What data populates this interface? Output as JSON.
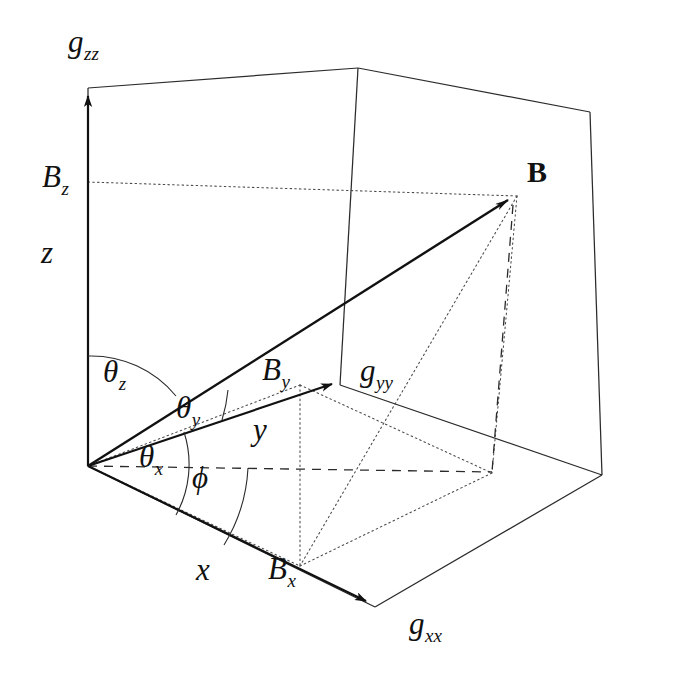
{
  "figure": {
    "type": "3d-vector-diagram",
    "background_color": "#ffffff",
    "line_color": "#1a1a1a"
  },
  "axes": [
    {
      "id": "z",
      "axis_label": "z",
      "tensor_label_base": "g",
      "tensor_label_sub": "zz",
      "component_base": "B",
      "component_sub": "z",
      "direction": "up"
    },
    {
      "id": "y",
      "axis_label": "y",
      "tensor_label_base": "g",
      "tensor_label_sub": "yy",
      "component_base": "B",
      "component_sub": "y",
      "direction": "upper-right"
    },
    {
      "id": "x",
      "axis_label": "x",
      "tensor_label_base": "g",
      "tensor_label_sub": "xx",
      "component_base": "B",
      "component_sub": "x",
      "direction": "lower-right"
    }
  ],
  "labels": {
    "g_zz": {
      "base": "g",
      "sub": "zz"
    },
    "g_yy": {
      "base": "g",
      "sub": "yy"
    },
    "g_xx": {
      "base": "g",
      "sub": "xx"
    },
    "B_z": {
      "base": "B",
      "sub": "z"
    },
    "B_y": {
      "base": "B",
      "sub": "y"
    },
    "B_x": {
      "base": "B",
      "sub": "x"
    },
    "z": {
      "base": "z",
      "sub": ""
    },
    "y": {
      "base": "y",
      "sub": ""
    },
    "x": {
      "base": "x",
      "sub": ""
    },
    "B_vector": {
      "base": "B",
      "sub": ""
    },
    "theta_z": {
      "base": "θ",
      "sub": "z"
    },
    "theta_y": {
      "base": "θ",
      "sub": "y"
    },
    "theta_x": {
      "base": "θ",
      "sub": "x"
    },
    "phi": {
      "base": "ϕ",
      "sub": ""
    }
  },
  "angles": [
    {
      "name": "theta_z",
      "between": "z-axis and B",
      "symbol": "θz"
    },
    {
      "name": "theta_y",
      "between": "y-axis and B",
      "symbol": "θy"
    },
    {
      "name": "theta_x",
      "between": "x-axis and B projection",
      "symbol": "θx"
    },
    {
      "name": "phi",
      "between": "azimuthal reference and x-axis",
      "symbol": "ϕ"
    }
  ],
  "line_styles": {
    "axis": "solid-with-arrow",
    "box_edge": "solid-thin",
    "projection": "dotted",
    "drop": "dashed"
  }
}
